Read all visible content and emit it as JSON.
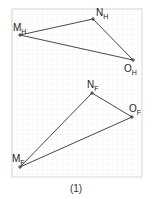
{
  "figure": {
    "caption": "(1)",
    "frame": {
      "x": 12,
      "y": 9,
      "width": 130,
      "height": 168,
      "stroke": "#cccccc",
      "grid_step": 5,
      "grid_color": "#ececec"
    },
    "line_color": "#333333",
    "triangles": [
      {
        "name": "H",
        "points": [
          {
            "id": "M",
            "sub": "H",
            "x": 20,
            "y": 35,
            "label_x": 13,
            "label_y": 31
          },
          {
            "id": "N",
            "sub": "H",
            "x": 93,
            "y": 19,
            "label_x": 96,
            "label_y": 16
          },
          {
            "id": "O",
            "sub": "H",
            "x": 133,
            "y": 60,
            "label_x": 124,
            "label_y": 72
          }
        ]
      },
      {
        "name": "F",
        "points": [
          {
            "id": "N",
            "sub": "F",
            "x": 92,
            "y": 93,
            "label_x": 87,
            "label_y": 88
          },
          {
            "id": "O",
            "sub": "F",
            "x": 132,
            "y": 117,
            "label_x": 129,
            "label_y": 112
          },
          {
            "id": "M",
            "sub": "F",
            "x": 20,
            "y": 167,
            "label_x": 12,
            "label_y": 162
          }
        ]
      }
    ]
  }
}
